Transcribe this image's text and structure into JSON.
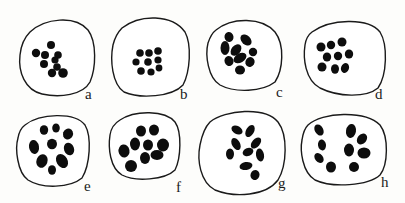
{
  "figure": {
    "colors": {
      "outline": "#1a1a1a",
      "blob": "#0d0d0d",
      "background": "#fdfdfb"
    },
    "cells": [
      {
        "label": "a",
        "outline": "M30,32 C45,18 75,15 88,30 C97,42 96,68 90,82 C83,95 60,98 42,94 C25,90 18,72 20,55 C21,45 24,38 30,32 Z",
        "label_pos": [
          85,
          99
        ],
        "blobs": [
          [
            51,
            45,
            4,
            4,
            0
          ],
          [
            36,
            53,
            4.2,
            4.2,
            0
          ],
          [
            45,
            55,
            4,
            4,
            0
          ],
          [
            58,
            55,
            3.8,
            3.8,
            0
          ],
          [
            55,
            60,
            3.6,
            3.6,
            0
          ],
          [
            44,
            64,
            4,
            4,
            0
          ],
          [
            57,
            67,
            3.8,
            3.8,
            0
          ],
          [
            52,
            73,
            4.2,
            4.2,
            0
          ],
          [
            63,
            73,
            4.8,
            4.8,
            0
          ]
        ]
      },
      {
        "label": "b",
        "outline": "M122,28 C140,14 172,14 185,32 C192,45 190,72 183,85 C172,97 140,99 124,92 C112,84 110,60 113,45 C115,37 118,32 122,28 Z",
        "label_pos": [
          180,
          99
        ],
        "blobs": [
          [
            140,
            53,
            3.8,
            3.8,
            0
          ],
          [
            149,
            53,
            3.8,
            3.8,
            0
          ],
          [
            158,
            51,
            3.8,
            3.8,
            0
          ],
          [
            136,
            62,
            3.6,
            3.6,
            0
          ],
          [
            148,
            62,
            3.8,
            3.8,
            0
          ],
          [
            158,
            60,
            3.6,
            3.6,
            0
          ],
          [
            159,
            68,
            3.4,
            3.4,
            0
          ],
          [
            141,
            71,
            3.8,
            3.8,
            0
          ],
          [
            151,
            72,
            3.6,
            3.6,
            0
          ]
        ]
      },
      {
        "label": "c",
        "outline": "M216,30 C232,17 262,17 275,32 C285,45 283,70 275,82 C262,92 235,93 220,85 C208,78 205,55 208,43 C210,37 212,33 216,30 Z",
        "label_pos": [
          276,
          97
        ],
        "blobs": [
          [
            229,
            37,
            4.5,
            5,
            -10
          ],
          [
            246,
            40,
            4.5,
            6.5,
            -45
          ],
          [
            225,
            48,
            4.5,
            7,
            0
          ],
          [
            236,
            50,
            4.5,
            6.5,
            40
          ],
          [
            253,
            52,
            4.2,
            4.2,
            0
          ],
          [
            240,
            58,
            4.5,
            7,
            60
          ],
          [
            229,
            61,
            4.5,
            5,
            -20
          ],
          [
            250,
            62,
            4.5,
            5,
            30
          ],
          [
            240,
            70,
            5,
            4.5,
            0
          ]
        ]
      },
      {
        "label": "d",
        "outline": "M312,32 C330,19 368,17 380,32 C388,45 387,75 378,88 C366,98 338,97 320,88 C305,80 303,58 305,45 C306,38 308,35 312,32 Z",
        "label_pos": [
          375,
          99
        ],
        "blobs": [
          [
            321,
            47,
            4.5,
            4.5,
            0
          ],
          [
            331,
            45,
            4.2,
            4.2,
            0
          ],
          [
            342,
            42,
            4.5,
            4.5,
            0
          ],
          [
            327,
            57,
            4.2,
            4.5,
            0
          ],
          [
            338,
            56,
            4.2,
            4.2,
            0
          ],
          [
            349,
            54,
            4.2,
            4.5,
            0
          ],
          [
            322,
            67,
            4.5,
            4.5,
            0
          ],
          [
            335,
            69,
            4,
            4.8,
            0
          ],
          [
            345,
            68,
            4,
            5,
            20
          ]
        ]
      },
      {
        "label": "e",
        "outline": "M25,125 C40,113 75,112 85,125 C92,137 90,165 82,178 C70,188 42,189 28,180 C17,172 15,148 18,138 C19,132 21,128 25,125 Z",
        "label_pos": [
          84,
          191
        ],
        "blobs": [
          [
            44,
            130,
            4.2,
            4.8,
            0
          ],
          [
            56,
            128,
            3.8,
            4.5,
            0
          ],
          [
            68,
            134,
            5,
            5.5,
            20
          ],
          [
            34,
            147,
            5,
            7,
            -10
          ],
          [
            52,
            144,
            5,
            5.2,
            0
          ],
          [
            69,
            149,
            5,
            6.5,
            -20
          ],
          [
            42,
            161,
            5.5,
            7,
            20
          ],
          [
            62,
            161,
            5.5,
            7.5,
            -30
          ],
          [
            52,
            170,
            4,
            4.8,
            0
          ]
        ]
      },
      {
        "label": "f",
        "outline": "M120,120 C135,110 165,110 175,122 C182,132 181,158 175,170 C165,180 135,182 122,175 C110,168 108,148 110,135 C111,128 115,123 120,120 Z",
        "label_pos": [
          176,
          192
        ],
        "blobs": [
          [
            141,
            131,
            5,
            5.5,
            0
          ],
          [
            154,
            130,
            5,
            5.5,
            0
          ],
          [
            135,
            144,
            5,
            6.5,
            0
          ],
          [
            148,
            145,
            5,
            5.5,
            0
          ],
          [
            163,
            145,
            6,
            6.5,
            0
          ],
          [
            124,
            151,
            5.5,
            6.5,
            -10
          ],
          [
            145,
            158,
            5,
            6,
            0
          ],
          [
            157,
            155,
            6.5,
            5,
            0
          ],
          [
            131,
            166,
            6,
            6,
            0
          ]
        ]
      },
      {
        "label": "g",
        "outline": "M210,122 C225,110 265,106 278,122 C288,135 287,165 278,180 C266,196 235,198 215,190 C200,182 197,160 200,145 C202,135 205,127 210,122 Z",
        "label_pos": [
          278,
          188
        ],
        "blobs": [
          [
            237,
            130,
            4,
            6,
            -60
          ],
          [
            250,
            131,
            4,
            6.5,
            30
          ],
          [
            236,
            144,
            4,
            6.5,
            -30
          ],
          [
            256,
            143,
            4,
            6.5,
            40
          ],
          [
            230,
            154,
            4,
            5.5,
            0
          ],
          [
            248,
            152,
            4,
            5.5,
            70
          ],
          [
            260,
            155,
            4,
            6.5,
            -10
          ],
          [
            246,
            166,
            4,
            6.5,
            80
          ],
          [
            255,
            175,
            4.5,
            5,
            20
          ]
        ]
      },
      {
        "label": "h",
        "outline": "M308,125 C322,112 365,110 380,125 C389,137 388,165 380,175 C368,186 332,188 315,180 C302,172 300,150 302,140 C303,133 305,128 308,125 Z",
        "label_pos": [
          381,
          187
        ],
        "blobs": [
          [
            319,
            130,
            4.2,
            6,
            -30
          ],
          [
            322,
            145,
            4,
            5.5,
            -10
          ],
          [
            319,
            158,
            4,
            5.5,
            -40
          ],
          [
            331,
            167,
            5,
            5.5,
            0
          ],
          [
            351,
            131,
            5,
            7,
            10
          ],
          [
            362,
            139,
            4.5,
            6,
            40
          ],
          [
            349,
            150,
            5,
            6.5,
            0
          ],
          [
            364,
            153,
            6.5,
            5.5,
            0
          ],
          [
            354,
            167,
            5,
            5,
            0
          ]
        ]
      }
    ]
  }
}
